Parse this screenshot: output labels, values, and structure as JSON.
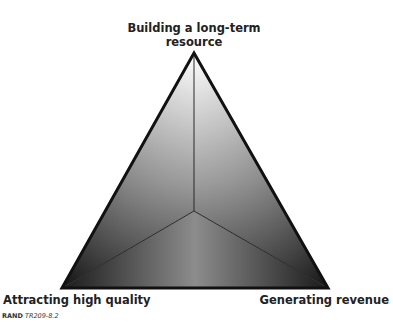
{
  "diagram": {
    "type": "triangle",
    "vertices": {
      "top": "Building a long-term resource",
      "bottom_left": "Attracting high quality",
      "bottom_right": "Generating revenue"
    },
    "colors": {
      "outline": "#111111",
      "fill_light": "#ffffff",
      "fill_dark": "#1a1a1a"
    }
  },
  "labels": {
    "top_line1": "Building a long-term",
    "top_line2": "resource",
    "bottom_left": "Attracting high quality",
    "bottom_right": "Generating revenue"
  },
  "footer": {
    "org": "RAND",
    "code": "TR209-8.2"
  }
}
